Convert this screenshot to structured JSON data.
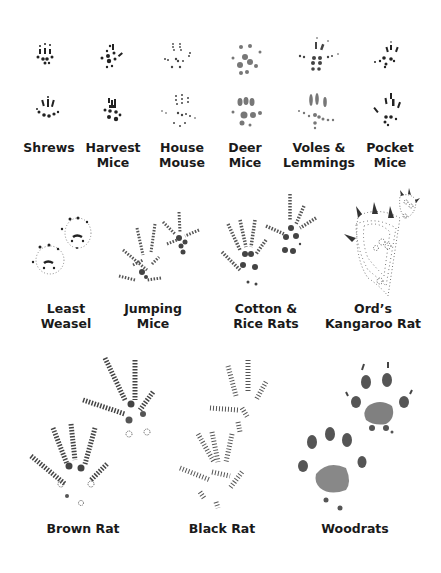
{
  "figure": {
    "colors": {
      "ink": "#1a1a1a",
      "stipple": "#444444",
      "background": "#ffffff"
    }
  },
  "rows": [
    {
      "row": 1,
      "species": [
        {
          "id": "shrews",
          "line1": "Shrews",
          "line2": ""
        },
        {
          "id": "harvest-mice",
          "line1": "Harvest",
          "line2": "Mice"
        },
        {
          "id": "house-mouse",
          "line1": "House",
          "line2": "Mouse"
        },
        {
          "id": "deer-mice",
          "line1": "Deer",
          "line2": "Mice"
        },
        {
          "id": "voles-lemmings",
          "line1": "Voles &",
          "line2": "Lemmings"
        },
        {
          "id": "pocket-mice",
          "line1": "Pocket",
          "line2": "Mice"
        }
      ]
    },
    {
      "row": 2,
      "species": [
        {
          "id": "least-weasel",
          "line1": "Least",
          "line2": "Weasel"
        },
        {
          "id": "jumping-mice",
          "line1": "Jumping",
          "line2": "Mice"
        },
        {
          "id": "cotton-rice-rats",
          "line1": "Cotton &",
          "line2": "Rice Rats"
        },
        {
          "id": "ords-kangaroo-rat",
          "line1": "Ord’s",
          "line2": "Kangaroo Rat"
        }
      ]
    },
    {
      "row": 3,
      "species": [
        {
          "id": "brown-rat",
          "line1": "Brown Rat",
          "line2": ""
        },
        {
          "id": "black-rat",
          "line1": "Black Rat",
          "line2": ""
        },
        {
          "id": "woodrats",
          "line1": "Woodrats",
          "line2": ""
        }
      ]
    }
  ]
}
